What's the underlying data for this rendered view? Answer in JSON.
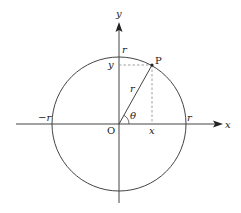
{
  "diagram": {
    "type": "unit-circle-polar-coordinates",
    "labels": {
      "x_axis": "x",
      "y_axis": "y",
      "origin": "O",
      "point": "P",
      "radius": "r",
      "angle": "θ",
      "r_top": "r",
      "r_right": "r",
      "r_left": "−r",
      "x_proj": "x",
      "y_proj": "y"
    },
    "colors": {
      "stroke": "#333333",
      "dashed": "#888888",
      "text": "#222222"
    }
  }
}
